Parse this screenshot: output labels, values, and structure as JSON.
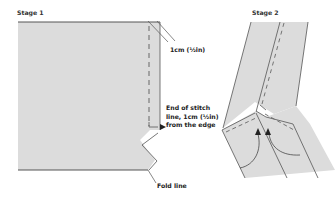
{
  "stage1": {
    "title": "Stage 1",
    "annotations": {
      "seam_allowance": "1cm (½in)",
      "stitch_end_line1": "End of stitch",
      "stitch_end_line2": "line, 1cm (½in)",
      "stitch_end_line3": "from the edge",
      "fold": "Fold line"
    }
  },
  "stage2": {
    "title": "Stage 2"
  },
  "colors": {
    "fabric_fill": "#dcdcdc",
    "outline": "#4a4a4a",
    "stitch": "#666666",
    "text": "#222222"
  }
}
